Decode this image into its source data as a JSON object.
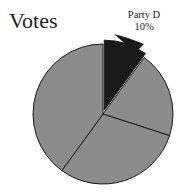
{
  "chart_data": {
    "type": "pie",
    "title": "Votes",
    "slices": [
      {
        "label": "Party D",
        "value": 10,
        "color": "#1a1a1a",
        "exploded": true,
        "shown_label": "Party D\n10%"
      },
      {
        "label": "",
        "value": 20,
        "color": "#8c8c8c"
      },
      {
        "label": "",
        "value": 30,
        "color": "#8c8c8c"
      },
      {
        "label": "",
        "value": 40,
        "color": "#8c8c8c"
      }
    ],
    "annotations": [
      "Party D",
      "10%"
    ],
    "legend": false
  },
  "title": "Votes",
  "label_name": "Party D",
  "label_value": "10%"
}
